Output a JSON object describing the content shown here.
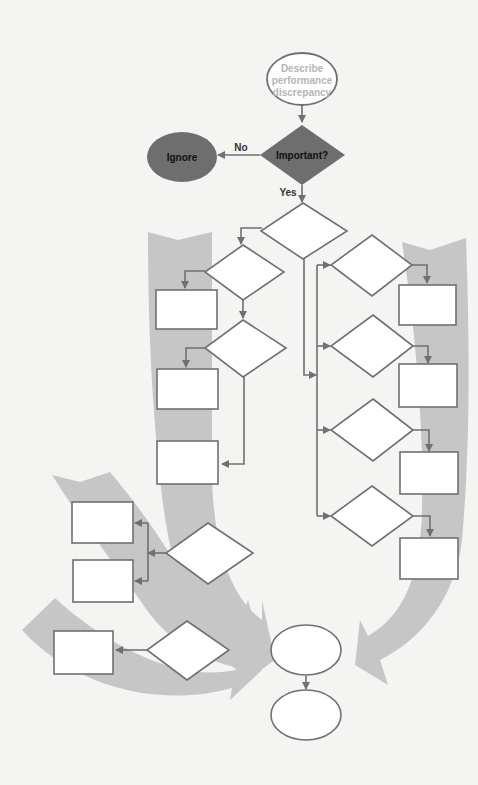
{
  "diagram": {
    "type": "flowchart",
    "colors": {
      "background": "#f4f4f2",
      "band": "#c6c6c6",
      "stroke": "#707070",
      "filled": "#6e6e6e",
      "start_text": "#b5b5b5",
      "filled_text": "#111111"
    },
    "nodes": {
      "start": {
        "shape": "ellipse",
        "lines": [
          "Describe",
          "performance",
          "discrepancy"
        ]
      },
      "decision_important": {
        "shape": "diamond",
        "label": "Important?"
      },
      "ignore": {
        "shape": "ellipse",
        "label": "Ignore"
      }
    },
    "edges": {
      "no_label": "No",
      "yes_label": "Yes"
    },
    "blank_shapes": {
      "diamonds": 9,
      "rectangles": 11,
      "ellipses": 2
    }
  }
}
